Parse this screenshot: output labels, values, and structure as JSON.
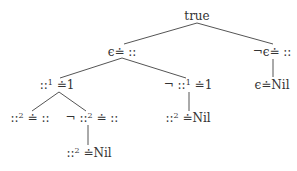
{
  "diagram": {
    "type": "tree",
    "nodes": [
      {
        "id": "root",
        "label": "true",
        "x": 197,
        "y": 16
      },
      {
        "id": "n1",
        "label": "ϵ≐ ::",
        "x": 122,
        "y": 52
      },
      {
        "id": "n2",
        "label": "¬ϵ≐ ::",
        "x": 272,
        "y": 52
      },
      {
        "id": "n3",
        "pre": "::",
        "sup": "1",
        "post": " ≐1",
        "x": 57,
        "y": 85
      },
      {
        "id": "n4",
        "pre": "¬ ::",
        "sup": "1",
        "post": " ≐1",
        "x": 188,
        "y": 85
      },
      {
        "id": "n5",
        "label": "ϵ≐Nil",
        "x": 272,
        "y": 85
      },
      {
        "id": "n6",
        "pre": "::",
        "sup": "2",
        "post": " ≐ ::",
        "x": 30,
        "y": 118
      },
      {
        "id": "n7",
        "pre": "¬ ::",
        "sup": "2",
        "post": " ≐ ::",
        "x": 92,
        "y": 118
      },
      {
        "id": "n8",
        "pre": "::",
        "sup": "2",
        "post": " ≐Nil",
        "x": 188,
        "y": 118
      },
      {
        "id": "n9",
        "pre": "::",
        "sup": "2",
        "post": " ≐Nil",
        "x": 89,
        "y": 153
      }
    ],
    "edges": [
      [
        "root",
        "n1"
      ],
      [
        "root",
        "n2"
      ],
      [
        "n1",
        "n3"
      ],
      [
        "n1",
        "n4"
      ],
      [
        "n2",
        "n5"
      ],
      [
        "n3",
        "n6"
      ],
      [
        "n3",
        "n7"
      ],
      [
        "n4",
        "n8"
      ],
      [
        "n7",
        "n9"
      ]
    ]
  },
  "labels": {
    "root": "true",
    "n1": "ϵ≐ ::",
    "n2": "¬ϵ≐ ::",
    "n3_pre": "::",
    "n3_sup": "1",
    "n3_post": " ≐1",
    "n4_pre": "¬ ::",
    "n4_sup": "1",
    "n4_post": " ≐1",
    "n5": "ϵ≐Nil",
    "n6_pre": "::",
    "n6_sup": "2",
    "n6_post": " ≐ ::",
    "n7_pre": "¬ ::",
    "n7_sup": "2",
    "n7_post": " ≐ ::",
    "n8_pre": "::",
    "n8_sup": "2",
    "n8_post": " ≐Nil",
    "n9_pre": "::",
    "n9_sup": "2",
    "n9_post": " ≐Nil"
  }
}
